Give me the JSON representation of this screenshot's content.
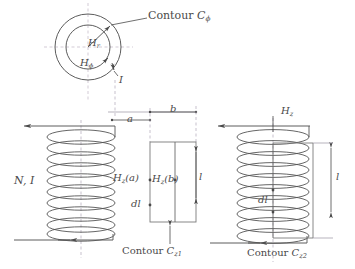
{
  "figure": {
    "title_present": false,
    "colors": {
      "line": "#4a4a4a",
      "coil": "#555555",
      "dashed": "#b0a8b8",
      "background": "#ffffff",
      "text": "#4a4a4a"
    }
  },
  "labels": {
    "contour_phi": {
      "prefix": "Contour",
      "symbol": "C",
      "sub": "ϕ"
    },
    "h_r": {
      "symbol": "H",
      "sub": "r"
    },
    "h_phi": {
      "symbol": "H",
      "sub": "ϕ"
    },
    "current_top": "I",
    "dim_a": "a",
    "dim_b": "b",
    "turns_current": "N, I",
    "h_z_a": {
      "symbol": "H",
      "sub": "z",
      "arg": "(a)"
    },
    "h_z_b": {
      "symbol": "H",
      "sub": "z",
      "arg": "(b)"
    },
    "dl_left": "dl",
    "len_left": "l",
    "contour_z1": {
      "prefix": "Contour",
      "symbol": "C",
      "sub": "z1"
    },
    "h_z_right": {
      "symbol": "H",
      "sub": "z"
    },
    "dl_right": "dl",
    "len_right": "l",
    "contour_z2": {
      "prefix": "Contour",
      "symbol": "C",
      "sub": "z2"
    }
  },
  "geometry": {
    "top_view": {
      "center_x": 88,
      "center_y": 47,
      "outer_radius": 33,
      "inner_radius": 22
    },
    "left_coil": {
      "x_left": 48,
      "x_right": 115,
      "y_top": 132,
      "y_bottom": 236,
      "turns": 10
    },
    "right_coil": {
      "x_left": 240,
      "x_right": 310,
      "y_top": 132,
      "y_bottom": 240,
      "turns": 10
    },
    "rect_contour_z1": {
      "x": 150,
      "y": 140,
      "width": 45,
      "height": 80
    },
    "rect_contour_z2": {
      "x": 273,
      "y": 143,
      "width": 40,
      "height": 100
    }
  }
}
